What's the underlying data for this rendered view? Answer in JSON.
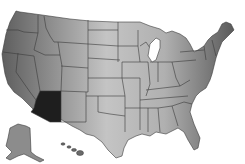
{
  "map": {
    "title": "United States",
    "highlighted_state": "Arizona",
    "colors": {
      "highlight": "#1e1e1e",
      "land_west": "#6e6e6e",
      "land_center": "#bdbdbd",
      "land_east": "#7a7a7a",
      "border": "#3a3a3a",
      "background": "#ffffff"
    },
    "insets": [
      "Alaska",
      "Hawaii"
    ]
  }
}
